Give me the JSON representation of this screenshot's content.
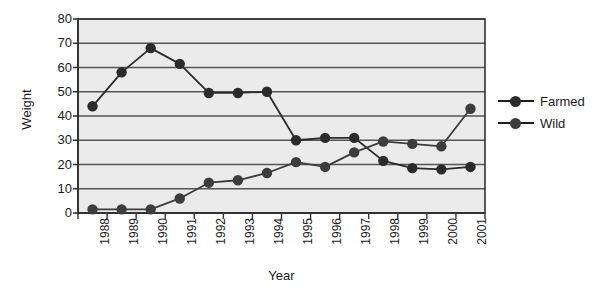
{
  "chart_data": {
    "type": "line",
    "title": "",
    "xlabel": "Year",
    "ylabel": "Weight",
    "categories": [
      "1988",
      "1989",
      "1990",
      "1991",
      "1992",
      "1993",
      "1994",
      "1995",
      "1996",
      "1997",
      "1998",
      "1999",
      "2000",
      "2001"
    ],
    "ylim": [
      0,
      80
    ],
    "yticks": [
      0,
      10,
      20,
      30,
      40,
      50,
      60,
      70,
      80
    ],
    "grid": true,
    "legend_position": "right",
    "series": [
      {
        "name": "Farmed",
        "color": "#2b2b2b",
        "values": [
          44,
          58,
          68,
          61.5,
          49.5,
          49.5,
          50,
          30,
          31,
          31,
          21.5,
          18.5,
          18,
          19
        ]
      },
      {
        "name": "Wild",
        "color": "#3d3d3d",
        "values": [
          1.5,
          1.5,
          1.5,
          6,
          12.5,
          13.5,
          16.5,
          21,
          19,
          25,
          29.5,
          28.5,
          27.5,
          43
        ]
      }
    ]
  },
  "axes": {
    "y_tick_labels": [
      "80",
      "70",
      "60",
      "50",
      "40",
      "30",
      "20",
      "10",
      "0"
    ],
    "x_tick_labels": [
      "1988",
      "1989",
      "1990",
      "1991",
      "1992",
      "1993",
      "1994",
      "1995",
      "1996",
      "1997",
      "1998",
      "1999",
      "2000",
      "2001"
    ],
    "y_axis_title": "Weight",
    "x_axis_title": "Year"
  },
  "legend": {
    "items": [
      {
        "label": "Farmed"
      },
      {
        "label": "Wild"
      }
    ]
  },
  "colors": {
    "plot_background": "#ebebeb",
    "gridline": "#555555",
    "axis": "#333333",
    "page_background": "#ffffff",
    "farmed": "#2b2b2b",
    "wild": "#3d3d3d"
  }
}
